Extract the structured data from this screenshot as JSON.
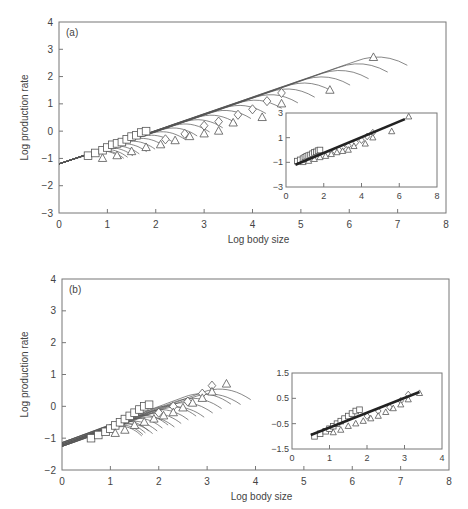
{
  "chart_data": [
    {
      "panel": "(a)",
      "type": "line",
      "xlabel": "Log body size",
      "ylabel": "Log production rate",
      "xlim": [
        0,
        8
      ],
      "ylim": [
        -3,
        4
      ],
      "xticks": [
        0,
        1,
        2,
        3,
        4,
        5,
        6,
        7,
        8
      ],
      "yticks": [
        -3,
        -2,
        -1,
        0,
        1,
        2,
        3,
        4
      ],
      "grid": false,
      "description": "Family of growth trajectories starting near (0, -1.2), rising with slope ~0.6 and bending downward at their end; markers (squares, diamonds, triangles) at trajectory endpoints.",
      "trajectories": {
        "origin": [
          0,
          -1.2
        ],
        "count": 24,
        "end_x_min": 1.3,
        "end_x_max": 7.2,
        "end_y_max": 3.0
      },
      "series": [
        {
          "name": "squares",
          "marker": "square",
          "points": [
            [
              0.6,
              -0.9
            ],
            [
              0.75,
              -0.8
            ],
            [
              0.9,
              -0.7
            ],
            [
              1.0,
              -0.6
            ],
            [
              1.1,
              -0.5
            ],
            [
              1.2,
              -0.45
            ],
            [
              1.3,
              -0.4
            ],
            [
              1.4,
              -0.3
            ],
            [
              1.5,
              -0.2
            ],
            [
              1.6,
              -0.15
            ],
            [
              1.7,
              -0.05
            ],
            [
              1.8,
              0.0
            ]
          ]
        },
        {
          "name": "diamonds",
          "marker": "diamond",
          "points": [
            [
              2.2,
              -0.3
            ],
            [
              2.6,
              -0.1
            ],
            [
              3.0,
              0.2
            ],
            [
              3.3,
              0.35
            ],
            [
              3.7,
              0.6
            ],
            [
              4.0,
              0.8
            ],
            [
              4.3,
              1.1
            ],
            [
              4.6,
              1.4
            ]
          ]
        },
        {
          "name": "triangles",
          "marker": "triangle",
          "points": [
            [
              0.9,
              -1.0
            ],
            [
              1.2,
              -0.9
            ],
            [
              1.5,
              -0.75
            ],
            [
              1.8,
              -0.6
            ],
            [
              2.1,
              -0.5
            ],
            [
              2.4,
              -0.35
            ],
            [
              2.7,
              -0.2
            ],
            [
              3.0,
              -0.1
            ],
            [
              3.3,
              0.0
            ],
            [
              3.6,
              0.3
            ],
            [
              4.2,
              0.5
            ],
            [
              4.6,
              1.0
            ],
            [
              5.6,
              1.5
            ],
            [
              6.5,
              2.7
            ]
          ]
        }
      ],
      "inset": {
        "type": "scatter",
        "xlim": [
          0,
          8
        ],
        "ylim": [
          -3,
          3
        ],
        "xticks": [
          0,
          2,
          4,
          6,
          8
        ],
        "yticks": [
          -3,
          -1,
          1,
          3
        ],
        "fit_line": {
          "x": [
            0.5,
            6.3
          ],
          "y": [
            -1.2,
            2.5
          ]
        }
      }
    },
    {
      "panel": "(b)",
      "type": "line",
      "xlabel": "Log body size",
      "ylabel": "Log production rate",
      "xlim": [
        0,
        8
      ],
      "ylim": [
        -2,
        4
      ],
      "xticks": [
        0,
        1,
        2,
        3,
        4,
        5,
        6,
        7,
        8
      ],
      "yticks": [
        -2,
        -1,
        0,
        1,
        2,
        3,
        4
      ],
      "grid": false,
      "description": "Family of growth trajectories starting near (0, -1.1 to -1.3), rising with slope ~0.6 and bending downward at their end; markers at trajectory endpoints.",
      "trajectories": {
        "origin": [
          0,
          -1.2
        ],
        "count": 18,
        "end_x_min": 1.65,
        "end_x_max": 3.9,
        "end_y_max": 0.75
      },
      "series": [
        {
          "name": "squares",
          "marker": "square",
          "points": [
            [
              0.6,
              -1.0
            ],
            [
              0.75,
              -0.9
            ],
            [
              0.9,
              -0.8
            ],
            [
              1.0,
              -0.7
            ],
            [
              1.1,
              -0.6
            ],
            [
              1.2,
              -0.5
            ],
            [
              1.3,
              -0.4
            ],
            [
              1.4,
              -0.3
            ],
            [
              1.5,
              -0.2
            ],
            [
              1.6,
              -0.1
            ],
            [
              1.7,
              0.0
            ],
            [
              1.8,
              0.05
            ]
          ]
        },
        {
          "name": "diamonds",
          "marker": "diamond",
          "points": [
            [
              2.0,
              -0.2
            ],
            [
              2.3,
              0.0
            ],
            [
              2.6,
              0.15
            ],
            [
              2.9,
              0.4
            ],
            [
              3.1,
              0.65
            ]
          ]
        },
        {
          "name": "triangles",
          "marker": "triangle",
          "points": [
            [
              1.1,
              -0.85
            ],
            [
              1.3,
              -0.75
            ],
            [
              1.5,
              -0.6
            ],
            [
              1.7,
              -0.5
            ],
            [
              1.9,
              -0.4
            ],
            [
              2.1,
              -0.3
            ],
            [
              2.3,
              -0.2
            ],
            [
              2.5,
              -0.05
            ],
            [
              2.7,
              0.1
            ],
            [
              2.9,
              0.25
            ],
            [
              3.1,
              0.45
            ],
            [
              3.4,
              0.7
            ]
          ]
        }
      ],
      "inset": {
        "type": "scatter",
        "xlim": [
          0,
          4
        ],
        "ylim": [
          -1.5,
          1.5
        ],
        "xticks": [
          0,
          1,
          2,
          3,
          4
        ],
        "yticks": [
          -1.5,
          -0.5,
          0.5,
          1.5
        ],
        "ytick_labels": [
          "-1.5",
          "-0.5",
          "0.5",
          "1.5"
        ],
        "fit_line": {
          "x": [
            0.5,
            3.4
          ],
          "y": [
            -0.95,
            0.75
          ]
        }
      }
    }
  ],
  "panels": [
    {
      "label": "(a)",
      "xlabel": "Log body size",
      "ylabel": "Log production rate",
      "frame": {
        "x0": 59,
        "x1": 446,
        "y0": 22,
        "y1": 213
      },
      "xlim": [
        0,
        8
      ],
      "ylim": [
        -3,
        4
      ],
      "xticks": [
        "0",
        "1",
        "2",
        "3",
        "4",
        "5",
        "6",
        "7",
        "8"
      ],
      "yticks": [
        "4",
        "3",
        "2",
        "1",
        "0",
        "-1",
        "-2",
        "-3"
      ],
      "inset": {
        "frame": {
          "x0": 286,
          "x1": 437,
          "y0": 113,
          "y1": 187
        },
        "xlim": [
          0,
          8
        ],
        "ylim": [
          -3,
          3
        ],
        "xticks": [
          "0",
          "2",
          "4",
          "6",
          "8"
        ],
        "yticks": [
          "3",
          "1",
          "-1",
          "-3"
        ]
      }
    },
    {
      "label": "(b)",
      "xlabel": "Log body size",
      "ylabel": "Log production rate",
      "frame": {
        "x0": 62,
        "x1": 449,
        "y0": 279,
        "y1": 470
      },
      "xlim": [
        0,
        8
      ],
      "ylim": [
        -2,
        4
      ],
      "xticks": [
        "0",
        "1",
        "2",
        "3",
        "4",
        "5",
        "6",
        "7",
        "8"
      ],
      "yticks": [
        "4",
        "3",
        "2",
        "1",
        "0",
        "-1",
        "-2"
      ],
      "inset": {
        "frame": {
          "x0": 292,
          "x1": 442,
          "y0": 373,
          "y1": 449
        },
        "xlim": [
          0,
          4
        ],
        "ylim": [
          -1.5,
          1.5
        ],
        "xticks": [
          "0",
          "1",
          "2",
          "3",
          "4"
        ],
        "yticks": [
          "1.5",
          "0.5",
          "-0.5",
          "-1.5"
        ]
      }
    }
  ]
}
